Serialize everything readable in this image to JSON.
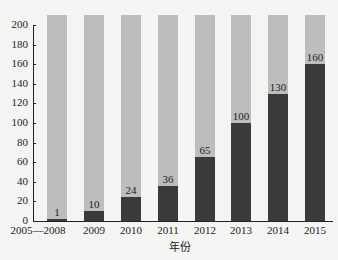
{
  "chart_data": {
    "type": "bar",
    "title": "",
    "xlabel": "年份",
    "ylabel": "",
    "ylim": [
      0,
      200
    ],
    "yticks": [
      0,
      20,
      40,
      60,
      80,
      100,
      120,
      140,
      160,
      180,
      200
    ],
    "categories": [
      "2005—2008",
      "2009",
      "2010",
      "2011",
      "2012",
      "2013",
      "2014",
      "2015"
    ],
    "values": [
      1,
      10,
      24,
      36,
      65,
      100,
      130,
      160
    ],
    "value_labels": [
      "1",
      "10",
      "24",
      "36",
      "65",
      "100",
      "130",
      "160"
    ],
    "background_bar_value": 210,
    "colors": {
      "bar": "#3a3a3a",
      "background_bar": "#bdbdbd",
      "axis": "#222222"
    },
    "grid": false,
    "legend": null
  }
}
